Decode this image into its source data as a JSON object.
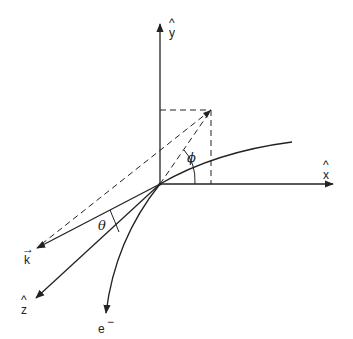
{
  "diagram": {
    "type": "vector-geometry",
    "colors": {
      "ink": "#222222",
      "background": "#ffffff"
    },
    "axes": {
      "y": {
        "label": "y",
        "hat": "^"
      },
      "x": {
        "label": "x",
        "hat": "^"
      }
    },
    "vectors": {
      "k": {
        "label": "k",
        "accent": "→"
      },
      "z": {
        "label": "z",
        "hat": "^"
      },
      "electron": {
        "label": "e",
        "superscript": "−"
      }
    },
    "angles": {
      "phi": {
        "label": "ϕ"
      },
      "theta": {
        "label": "θ"
      }
    }
  }
}
